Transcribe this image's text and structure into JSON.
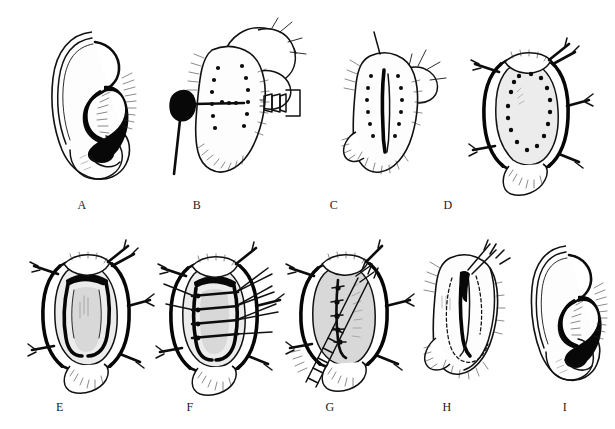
{
  "figure": {
    "header_fragment": "耳廓整形术：沿耳后切口显露软骨并以褥式缝合塑造对耳轮",
    "background_color": "#ffffff",
    "ink_color": "#111111",
    "panel_count": 9,
    "panels": [
      {
        "id": "A",
        "caption": "A",
        "subject": "normal-ear-lateral-view",
        "description": "Lateral view of the auricle showing helix, antihelix, concha and lobule before surgery"
      },
      {
        "id": "B",
        "caption": "B",
        "subject": "postauricular-marking-with-needle",
        "description": "Posterior surface of the ear steadied by the surgeon's fingers; dotted line marks the planned skin excision; a dye-loaded needle and a clamp are applied"
      },
      {
        "id": "C",
        "caption": "C",
        "subject": "postauricular-incision-line",
        "description": "Posterior aspect of the ear with the vertical incision line drawn between the two dotted marking rows"
      },
      {
        "id": "D",
        "caption": "D",
        "subject": "skin-excised-cartilage-exposed",
        "description": "Postauricular skin ellipse excised and retracted with hooks, exposing cartilage; dotted oval outlines the antihelix to be formed"
      },
      {
        "id": "E",
        "caption": "E",
        "subject": "cartilage-scored-u-flap",
        "description": "Cartilage incised along the marked outline creating a U-shaped antihelical strip"
      },
      {
        "id": "F",
        "caption": "F",
        "subject": "mattress-sutures-placed",
        "description": "Horizontal mattress sutures passed across the cartilage to fold and shape the new antihelix"
      },
      {
        "id": "G",
        "caption": "G",
        "subject": "sutures-tied-with-forceps",
        "description": "Sutures tied while forceps hold the cartilage fold; the antihelical roll is set"
      },
      {
        "id": "H",
        "caption": "H",
        "subject": "skin-closure",
        "description": "Postauricular wound closed; dashed line shows the position of the buried cartilage fold"
      },
      {
        "id": "I",
        "caption": "I",
        "subject": "corrected-ear-result",
        "description": "Lateral view of the corrected auricle with a well-defined antihelix"
      }
    ]
  }
}
